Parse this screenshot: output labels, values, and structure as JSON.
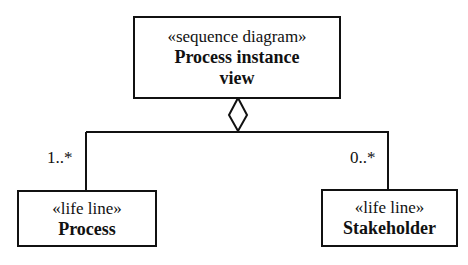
{
  "diagram": {
    "container": {
      "stereotype": "«sequence diagram»",
      "name_line1": "Process instance",
      "name_line2": "view"
    },
    "left": {
      "stereotype": "«life line»",
      "name": "Process",
      "multiplicity": "1..*"
    },
    "right": {
      "stereotype": "«life line»",
      "name": "Stakeholder",
      "multiplicity": "0..*"
    },
    "relationship": "aggregation"
  }
}
